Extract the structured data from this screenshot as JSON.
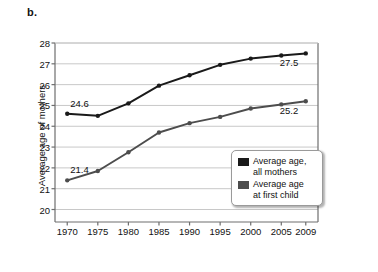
{
  "figure": {
    "panel_letter": "b.",
    "background_color": "#ffffff"
  },
  "chart_data": {
    "type": "line",
    "title": "",
    "subtitle": "",
    "xlabel": "",
    "ylabel": "Average age of mothers",
    "x": [
      1970,
      1975,
      1980,
      1985,
      1990,
      1995,
      2000,
      2005,
      2009
    ],
    "categories": [
      "1970",
      "1975",
      "1980",
      "1985",
      "1990",
      "1995",
      "2000",
      "2005",
      "2009"
    ],
    "xlim": [
      1968,
      2011
    ],
    "ylim": [
      19.4,
      28
    ],
    "yticks": [
      20,
      21,
      22,
      23,
      24,
      25,
      26,
      27,
      28
    ],
    "ytick_labels": [
      "20",
      "21",
      "22",
      "23",
      "24",
      "25",
      "26",
      "27",
      "28"
    ],
    "grid": "horizontal",
    "legend_position": "bottom-right",
    "series": [
      {
        "name": "Average age, all mothers",
        "color": "#1a1a1a",
        "marker": "circle",
        "values": [
          24.6,
          24.5,
          25.1,
          25.95,
          26.45,
          26.95,
          27.25,
          27.4,
          27.5
        ]
      },
      {
        "name": "Average age at first child",
        "color": "#4d4d4d",
        "marker": "circle",
        "values": [
          21.4,
          21.85,
          22.75,
          23.7,
          24.15,
          24.45,
          24.85,
          25.05,
          25.2
        ]
      }
    ],
    "annotations": [
      {
        "text": "24.6",
        "series": "Average age, all mothers",
        "x": 1970,
        "y": 24.6,
        "position": "above"
      },
      {
        "text": "27.5",
        "series": "Average age, all mothers",
        "x": 2009,
        "y": 27.5,
        "position": "below-right"
      },
      {
        "text": "21.4",
        "series": "Average age at first child",
        "x": 1970,
        "y": 21.4,
        "position": "above"
      },
      {
        "text": "25.2",
        "series": "Average age at first child",
        "x": 2009,
        "y": 25.2,
        "position": "below-right"
      }
    ]
  },
  "legend": {
    "entries": [
      {
        "label": "Average age,\nall mothers",
        "color": "#1a1a1a"
      },
      {
        "label": "Average age\nat first child",
        "color": "#4d4d4d"
      }
    ]
  },
  "colors": {
    "all_mothers": "#1a1a1a",
    "first_child": "#4d4d4d",
    "gridline": "#c8c8c8",
    "axis": "#6e6e6e",
    "text": "#111111"
  }
}
